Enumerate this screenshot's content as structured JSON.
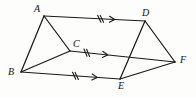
{
  "figure": {
    "canvas": {
      "width": 196,
      "height": 97
    },
    "stroke_color": "#1a1a1a",
    "label_color": "#101010",
    "background_color": "#fdfdfc"
  },
  "vertices": [
    {
      "id": "A",
      "label": "A",
      "x": 44,
      "y": 16,
      "label_x": 34,
      "label_y": 4
    },
    {
      "id": "B",
      "label": "B",
      "x": 21,
      "y": 72,
      "label_x": 8,
      "label_y": 67
    },
    {
      "id": "C",
      "label": "C",
      "x": 70,
      "y": 51,
      "label_x": 73,
      "label_y": 39
    },
    {
      "id": "D",
      "label": "D",
      "x": 145,
      "y": 21,
      "label_x": 142,
      "label_y": 8
    },
    {
      "id": "E",
      "label": "E",
      "x": 120,
      "y": 79,
      "label_x": 118,
      "label_y": 81
    },
    {
      "id": "F",
      "label": "F",
      "x": 175,
      "y": 62,
      "label_x": 180,
      "label_y": 55
    }
  ],
  "edges": [
    {
      "id": "AB",
      "from": "A",
      "to": "B",
      "name": "edge-a-b"
    },
    {
      "id": "AC",
      "from": "A",
      "to": "C",
      "name": "edge-a-c"
    },
    {
      "id": "BC",
      "from": "B",
      "to": "C",
      "name": "edge-b-c"
    },
    {
      "id": "AD",
      "from": "A",
      "to": "D",
      "name": "edge-a-d"
    },
    {
      "id": "CF",
      "from": "C",
      "to": "F",
      "name": "edge-c-f"
    },
    {
      "id": "BE",
      "from": "B",
      "to": "E",
      "name": "edge-b-e"
    },
    {
      "id": "DE",
      "from": "D",
      "to": "E",
      "name": "edge-d-e"
    },
    {
      "id": "DF",
      "from": "D",
      "to": "F",
      "name": "edge-d-f"
    },
    {
      "id": "EF",
      "from": "E",
      "to": "F",
      "name": "edge-e-f"
    }
  ],
  "marks": [
    {
      "edge": "AD",
      "name": "parallel-mark-ad",
      "tick_count": 2,
      "tick_symbol": "//",
      "tick_t": 0.56,
      "arrow_t": 0.7,
      "meaning": "parallel-and-congruent"
    },
    {
      "edge": "CF",
      "name": "parallel-mark-cf",
      "tick_count": 2,
      "tick_symbol": "//",
      "tick_t": 0.16,
      "arrow_t": 0.36,
      "meaning": "parallel-and-congruent"
    },
    {
      "edge": "BE",
      "name": "parallel-mark-be",
      "tick_count": 2,
      "tick_symbol": "//",
      "tick_t": 0.55,
      "arrow_t": 0.77,
      "meaning": "parallel-and-congruent"
    }
  ]
}
